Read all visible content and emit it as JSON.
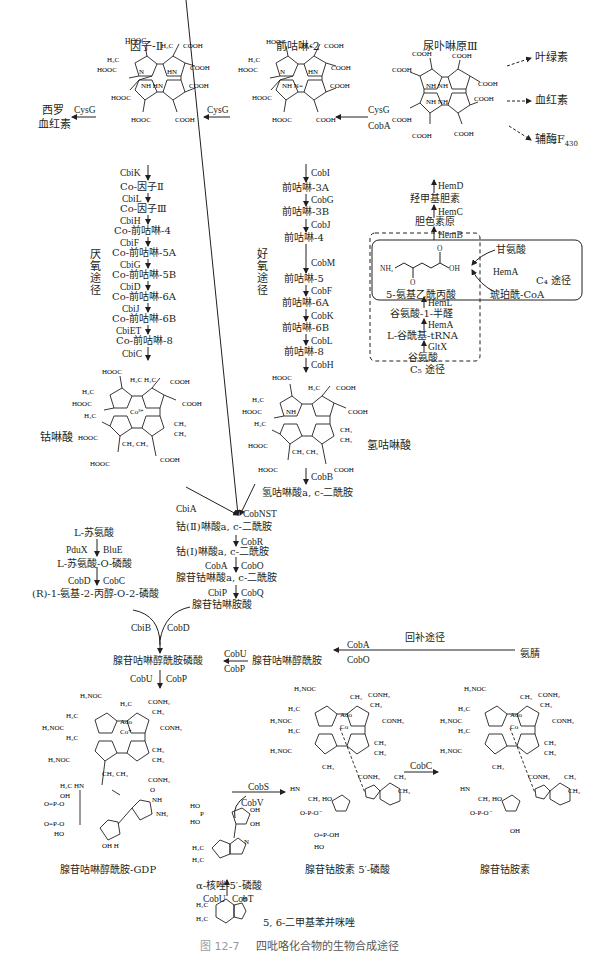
{
  "figure": {
    "caption_number": "图 12-7",
    "caption_title": "四吡咯化合物的生物合成途径"
  },
  "top_compounds": {
    "factor2": {
      "name": "因子-Ⅱ"
    },
    "precorrin2": {
      "name": "前咕啉-2"
    },
    "uroporphyrinogen3": {
      "name": "尿卟啉原Ⅲ"
    }
  },
  "branch_products": {
    "chlorophyll": "叶绿素",
    "heme": "血红素",
    "f430": "辅酶F",
    "f430_sub": "430",
    "sirohaem_line1": "西罗",
    "sirohaem_line2": "血红素"
  },
  "top_enzymes": {
    "cysg_left": "CysG",
    "cysg_mid": "CysG",
    "cysg_right": "CysG",
    "coba_right": "CobA"
  },
  "anaerobic": {
    "label": "厌氧途径",
    "steps": [
      {
        "enzyme": "CbiK",
        "product": "Co-因子Ⅱ"
      },
      {
        "enzyme": "CbiL",
        "product": "Co-因子Ⅲ"
      },
      {
        "enzyme": "CbiH",
        "product": "Co-前咕啉-4"
      },
      {
        "enzyme": "CbiF",
        "product": "Co-前咕啉-5A"
      },
      {
        "enzyme": "CbiG",
        "product": "Co-前咕啉-5B"
      },
      {
        "enzyme": "CbiD",
        "product": "Co-前咕啉-6A"
      },
      {
        "enzyme": "CbiJ",
        "product": "Co-前咕啉-6B"
      },
      {
        "enzyme": "CbiET",
        "product": "Co-前咕啉-8"
      },
      {
        "enzyme": "CbiC",
        "product": ""
      }
    ],
    "end_product": "钴啉酸"
  },
  "aerobic": {
    "label": "好氧途径",
    "steps": [
      {
        "enzyme": "CobI",
        "product": "前咕啉-3A"
      },
      {
        "enzyme": "CobG",
        "product": "前咕啉-3B"
      },
      {
        "enzyme": "CobJ",
        "product": "前咕啉-4"
      },
      {
        "enzyme": "CobM",
        "product": "前咕啉-5"
      },
      {
        "enzyme": "CobF",
        "product": "前咕啉-6A"
      },
      {
        "enzyme": "CobK",
        "product": "前咕啉-6B"
      },
      {
        "enzyme": "CobL",
        "product": "前咕啉-8"
      },
      {
        "enzyme": "CobH",
        "product": ""
      }
    ],
    "end_product": "氢咕啉酸",
    "cobb_enzyme": "CobB",
    "diamide": "氢咕啉酸a, c-二酰胺"
  },
  "heme_path": {
    "hemd": "HemD",
    "hydroxymethylbilane": "羟甲基胆素",
    "hemc": "HemC",
    "porphobilinogen": "胆色素原",
    "hemb": "HemB",
    "ala": "5-氨基乙酰丙酸",
    "ala_groups": {
      "nh2": "NH₂",
      "oh": "OH",
      "o1": "O",
      "o2": "O"
    },
    "c4": {
      "glycine": "甘氨酸",
      "hema": "HemA",
      "succinyl": "琥珀酰-CoA",
      "label": "C₄ 途径"
    },
    "c5": {
      "heml": "HemL",
      "gsa": "谷氨酸-1-半醛",
      "hema": "HemA",
      "glu_trna": "L-谷酰基-tRNA",
      "gltx": "GltX",
      "glutamate": "谷氨酸",
      "label": "C₅ 途径"
    }
  },
  "convergence": {
    "cbia": "CbiA",
    "cobnst": "CobNST",
    "co2_diamide": "钴(Ⅱ)啉酸a, c-二酰胺",
    "cobr": "CobR",
    "co1_diamide": "钴(Ⅰ)啉酸a, c-二酰胺",
    "coba": "CobA",
    "cobo": "CobO",
    "ado_diamide": "腺苷钴啉酸a, c-二酰胺",
    "cbip": "CbiP",
    "cobq": "CobQ",
    "ado_cobyric": "腺苷钴啉胺酸"
  },
  "threonine": {
    "thr": "L-苏氨酸",
    "pdux": "PduX",
    "blue": "BluE",
    "thr_p": "L-苏氨酸-O-磷酸",
    "cobd": "CobD",
    "cobc": "CobC",
    "amino_propanol": "(R)-1-氨基-2-丙醇-O-2-磷酸"
  },
  "lower": {
    "cbib": "CbiB",
    "cobd": "CobD",
    "adocbi_p": "腺苷咕啉醇酰胺磷酸",
    "cobu_a": "CobU",
    "cobp_a": "CobP",
    "adocbi": "腺苷咕啉醇酰胺",
    "coba": "CobA",
    "cobo": "CobO",
    "salvage": "回补途径",
    "cobinamide": "氨腈",
    "cobu_b": "CobU",
    "cobp_b": "CobP",
    "gdp": "腺苷咕啉醇酰胺-GDP",
    "cobs": "CobS",
    "cobv": "CobV",
    "rp": "α-核唑-5′-磷酸",
    "cobu_c": "CobU",
    "cobt": "CobT",
    "dmb": "5, 6-二甲基苯并咪唑",
    "adocbl_p": "腺苷钴胺素 5′-磷酸",
    "cobc": "CobC",
    "adocbl": "腺苷钴胺素"
  }
}
